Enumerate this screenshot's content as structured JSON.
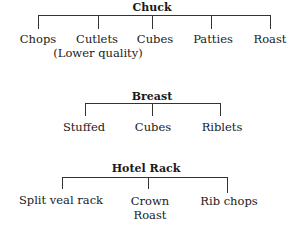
{
  "diagram": {
    "trees": [
      {
        "title": "Chuck",
        "children": [
          {
            "label": "Chops"
          },
          {
            "label": "Cutlets",
            "note": "(Lower quality)"
          },
          {
            "label": "Cubes"
          },
          {
            "label": "Patties"
          },
          {
            "label": "Roast"
          }
        ]
      },
      {
        "title": "Breast",
        "children": [
          {
            "label": "Stuffed"
          },
          {
            "label": "Cubes"
          },
          {
            "label": "Riblets"
          }
        ]
      },
      {
        "title": "Hotel Rack",
        "children": [
          {
            "label": "Split veal rack"
          },
          {
            "label": "Crown",
            "note": "Roast"
          },
          {
            "label": "Rib chops"
          }
        ]
      }
    ]
  }
}
